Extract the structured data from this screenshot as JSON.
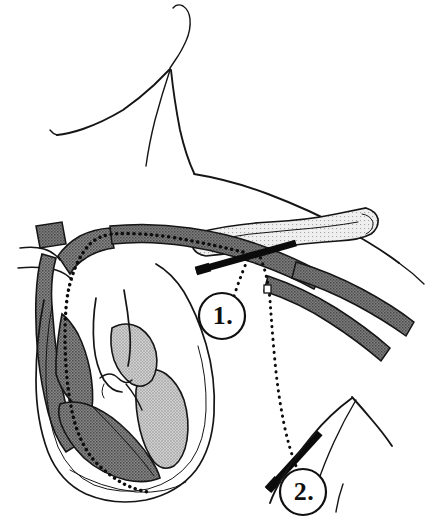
{
  "figure": {
    "width": 435,
    "height": 528,
    "background_color": "#ffffff",
    "ink_color": "#151515"
  },
  "labels": [
    {
      "id": "callout-1",
      "text": "1.",
      "cx": 222,
      "cy": 316,
      "r": 23,
      "description": "infraclavicular subclavian needle approach"
    },
    {
      "id": "callout-2",
      "text": "2.",
      "cx": 303,
      "cy": 492,
      "r": 23,
      "description": "axillary deltopectoral needle approach"
    }
  ],
  "anatomy": {
    "body_outline": "head chin jaw neck sternocleidomastoid shoulder contour",
    "bone": "clavicle",
    "vessels": [
      "brachiocephalic vein stub",
      "superior vena cava",
      "subclavian vein",
      "axillary vein",
      "axillary artery"
    ],
    "heart_chambers": [
      "right atrium",
      "right ventricle",
      "left atrium",
      "left ventricle",
      "aorta"
    ]
  },
  "devices": {
    "catheter": {
      "name": "catheter-path",
      "style": "dotted",
      "route": "subclavian vein to superior vena cava to right atrium to right ventricle apex"
    },
    "needles": [
      {
        "name": "needle-infraclavicular",
        "style": "solid-black-bar"
      },
      {
        "name": "needle-axillary",
        "style": "solid-black-bar"
      }
    ]
  },
  "colors": {
    "ink": "#151515",
    "vessel_dark": "#6e6e6e",
    "chamber_dark": "#727272",
    "chamber_light": "#b9b9b9",
    "bone_light": "#e8e8e8",
    "needle": "#0b0b0b",
    "background": "#ffffff"
  }
}
